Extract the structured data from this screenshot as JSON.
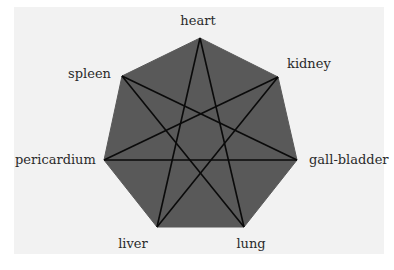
{
  "diagram": {
    "shape": "heptagon with inscribed heptagram {7/3}",
    "colors": {
      "fill": "#595959",
      "lines": "#0a0a0a",
      "background": "#f2f2f2",
      "text": "#2a2a2a"
    },
    "nodes": [
      {
        "id": "heart",
        "label": "heart",
        "x": 200,
        "y": 38
      },
      {
        "id": "kidney",
        "label": "kidney",
        "x": 278,
        "y": 77
      },
      {
        "id": "gall-bladder",
        "label": "gall-bladder",
        "x": 297,
        "y": 160
      },
      {
        "id": "lung",
        "label": "lung",
        "x": 244,
        "y": 227
      },
      {
        "id": "liver",
        "label": "liver",
        "x": 157,
        "y": 227
      },
      {
        "id": "pericardium",
        "label": "pericardium",
        "x": 104,
        "y": 160
      },
      {
        "id": "spleen",
        "label": "spleen",
        "x": 122,
        "y": 76
      }
    ],
    "edges": [
      [
        "heart",
        "liver"
      ],
      [
        "heart",
        "lung"
      ],
      [
        "kidney",
        "pericardium"
      ],
      [
        "kidney",
        "liver"
      ],
      [
        "spleen",
        "gall-bladder"
      ],
      [
        "spleen",
        "lung"
      ],
      [
        "pericardium",
        "gall-bladder"
      ]
    ]
  }
}
